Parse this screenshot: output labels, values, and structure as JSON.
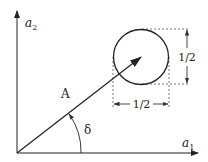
{
  "diagram": {
    "axes": {
      "x_label": "a",
      "x_subscript": "1",
      "y_label": "a",
      "y_subscript": "2"
    },
    "vector": {
      "label": "A",
      "angle_label": "δ"
    },
    "circle": {
      "width_label": "1/2",
      "height_label": "1/2"
    },
    "colors": {
      "stroke": "#222222",
      "dashed": "#555555",
      "background": "#ffffff"
    }
  }
}
